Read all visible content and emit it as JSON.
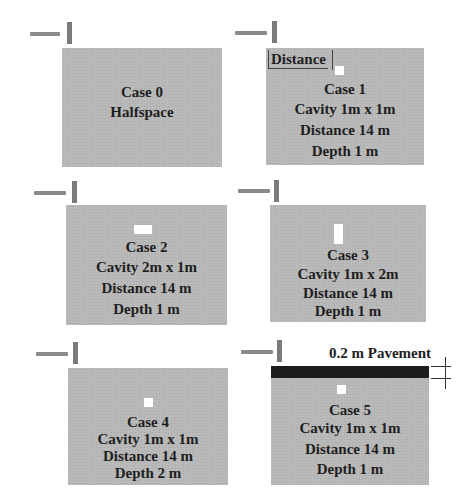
{
  "colors": {
    "medium": "#b9b9b9",
    "cavity": "#ffffff",
    "pavement": "#1c1c1c",
    "source": "#8a8a8a",
    "text": "#1e1e1e"
  },
  "cases": [
    {
      "id": 0,
      "lines": [
        "Case 0",
        "Halfspace"
      ]
    },
    {
      "id": 1,
      "annotation": "Distance",
      "lines": [
        "Case 1",
        "Cavity 1m x 1m",
        "Distance 14 m",
        "Depth 1 m"
      ]
    },
    {
      "id": 2,
      "lines": [
        "Case 2",
        "Cavity 2m x 1m",
        "Distance 14 m",
        "Depth 1 m"
      ]
    },
    {
      "id": 3,
      "lines": [
        "Case 3",
        "Cavity 1m x 2m",
        "Distance 14 m",
        "Depth 1 m"
      ]
    },
    {
      "id": 4,
      "lines": [
        "Case 4",
        "Cavity 1m x 1m",
        "Distance 14 m",
        "Depth 2 m"
      ]
    },
    {
      "id": 5,
      "annotation": "0.2 m Pavement",
      "lines": [
        "Case 5",
        "Cavity 1m x 1m",
        "Distance 14 m",
        "Depth 1 m"
      ]
    }
  ]
}
